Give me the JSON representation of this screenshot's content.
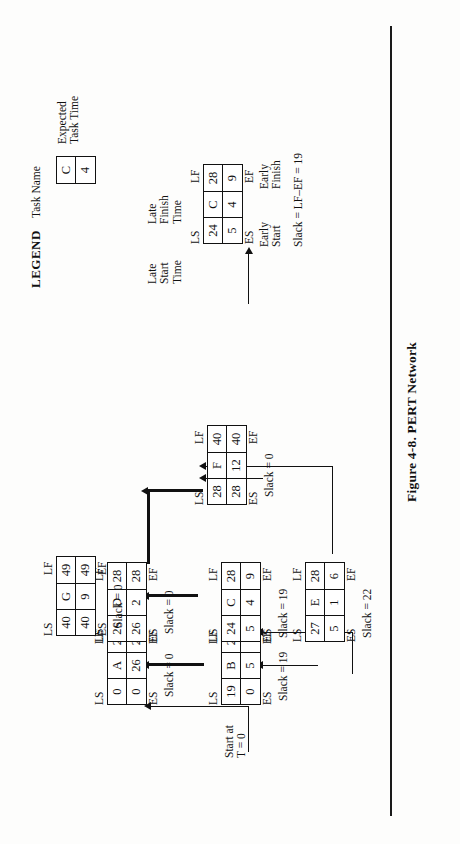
{
  "figure": {
    "caption": "Figure 4-8.  PERT Network",
    "start_label_line1": "Start at",
    "start_label_line2": "T = 0"
  },
  "node_headers": {
    "ls": "LS",
    "lf": "LF",
    "es": "ES",
    "ef": "EF"
  },
  "slack_prefix": "Slack = ",
  "nodes": [
    {
      "id": "A",
      "name": "A",
      "ls": "0",
      "lf": "26",
      "es": "0",
      "duration": "26",
      "ef": "26",
      "slack": "Slack = 0",
      "critical": true
    },
    {
      "id": "B",
      "name": "B",
      "ls": "19",
      "lf": "24",
      "es": "0",
      "duration": "5",
      "ef": "5",
      "slack": "Slack = 19",
      "critical": false
    },
    {
      "id": "C",
      "name": "C",
      "ls": "24",
      "lf": "28",
      "es": "5",
      "duration": "4",
      "ef": "9",
      "slack": "Slack = 19",
      "critical": false
    },
    {
      "id": "D",
      "name": "D",
      "ls": "26",
      "lf": "28",
      "es": "26",
      "duration": "2",
      "ef": "28",
      "slack": "Slack = 0",
      "critical": true
    },
    {
      "id": "E",
      "name": "E",
      "ls": "27",
      "lf": "28",
      "es": "5",
      "duration": "1",
      "ef": "6",
      "slack": "Slack = 22",
      "critical": false
    },
    {
      "id": "F",
      "name": "F",
      "ls": "28",
      "lf": "40",
      "es": "28",
      "duration": "12",
      "ef": "40",
      "slack": "Slack = 0",
      "critical": true
    },
    {
      "id": "G",
      "name": "G",
      "ls": "40",
      "lf": "49",
      "es": "40",
      "duration": "9",
      "ef": "49",
      "slack": "Slack = 0",
      "critical": true
    }
  ],
  "legend": {
    "title": "LEGEND",
    "task_name_label": "Task Name",
    "expected_time_line1": "Expected",
    "expected_time_line2": "Task Time",
    "late_start_line1": "Late",
    "late_start_line2": "Start",
    "late_start_line3": "Time",
    "late_finish_line1": "Late",
    "late_finish_line2": "Finish",
    "late_finish_line3": "Time",
    "early_start_line1": "Early",
    "early_start_line2": "Start",
    "early_finish_line1": "Early",
    "early_finish_line2": "Finish",
    "slack_formula": "Slack = LF–EF = 19",
    "sample_node": {
      "name": "C",
      "ls": "24",
      "lf": "28",
      "es": "5",
      "duration": "4",
      "ef": "9"
    },
    "mini_box": {
      "name": "C",
      "duration": "4"
    },
    "ls": "LS",
    "lf": "LF",
    "es": "ES",
    "ef": "EF"
  }
}
